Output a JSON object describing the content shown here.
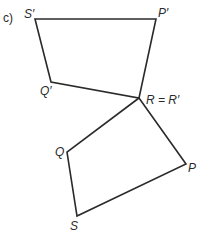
{
  "part_label": "c)",
  "colors": {
    "line": "#2a2a2a",
    "text": "#2a2a2a",
    "background": "#ffffff"
  },
  "shapes": {
    "image": {
      "name": "quadrilateral P'Q'R'S'",
      "vertices": [
        {
          "label": "S'",
          "x": 35,
          "y": 19
        },
        {
          "label": "P'",
          "x": 156,
          "y": 19
        },
        {
          "label": "R = R'",
          "x": 139,
          "y": 98
        },
        {
          "label": "Q'",
          "x": 51,
          "y": 82
        }
      ]
    },
    "object": {
      "name": "quadrilateral PQRS",
      "vertices": [
        {
          "label": "R",
          "x": 139,
          "y": 98
        },
        {
          "label": "P",
          "x": 186,
          "y": 164
        },
        {
          "label": "S",
          "x": 77,
          "y": 216
        },
        {
          "label": "Q",
          "x": 67,
          "y": 152
        }
      ]
    }
  },
  "labels": {
    "S_prime": "S′",
    "P_prime": "P′",
    "Q_prime": "Q′",
    "R_eq": "R = R′",
    "Q": "Q",
    "P": "P",
    "S": "S"
  }
}
